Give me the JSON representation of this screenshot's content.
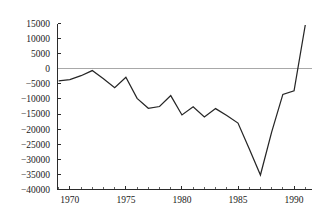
{
  "chart_data": {
    "type": "line",
    "title": "",
    "subtitle": "",
    "xlabel": "",
    "ylabel": "",
    "xlim": [
      1968.9,
      1991.6
    ],
    "ylim": [
      -40000,
      15000
    ],
    "grid": false,
    "legend": null,
    "zero_reference_line": 0,
    "zero_line_color": "#a8a8a8",
    "line_color": "#262626",
    "x_ticks_major": [
      1970,
      1975,
      1980,
      1985,
      1990
    ],
    "x_tick_labels": [
      "1970",
      "1975",
      "1980",
      "1985",
      "1990"
    ],
    "x_ticks_minor": [
      1969,
      1971,
      1972,
      1973,
      1974,
      1976,
      1977,
      1978,
      1979,
      1981,
      1982,
      1983,
      1984,
      1986,
      1987,
      1988,
      1989,
      1991
    ],
    "y_ticks": [
      15000,
      10000,
      5000,
      0,
      -5000,
      -10000,
      -15000,
      -20000,
      -25000,
      -30000,
      -35000,
      -40000
    ],
    "y_tick_labels": [
      "15000",
      "10000",
      "5000",
      "0",
      "−5000",
      "−10000",
      "−15000",
      "−20000",
      "−25000",
      "−30000",
      "−35000",
      "−40000"
    ],
    "x": [
      1969,
      1970,
      1971,
      1972,
      1973,
      1974,
      1975,
      1976,
      1977,
      1978,
      1979,
      1980,
      1981,
      1982,
      1983,
      1984,
      1985,
      1986,
      1987,
      1988,
      1989,
      1990,
      1991
    ],
    "values": [
      -4000,
      -3600,
      -2300,
      -600,
      -3300,
      -6300,
      -2800,
      -9800,
      -13100,
      -12500,
      -8900,
      -15300,
      -12600,
      -16000,
      -13200,
      -15500,
      -18000,
      -26500,
      -35200,
      -21000,
      -8500,
      -7300,
      14500
    ],
    "series": [
      {
        "name": "series-1",
        "values": [
          -4000,
          -3600,
          -2300,
          -600,
          -3300,
          -6300,
          -2800,
          -9800,
          -13100,
          -12500,
          -8900,
          -15300,
          -12600,
          -16000,
          -13200,
          -15500,
          -18000,
          -26500,
          -35200,
          -21000,
          -8500,
          -7300,
          14500
        ]
      }
    ]
  }
}
